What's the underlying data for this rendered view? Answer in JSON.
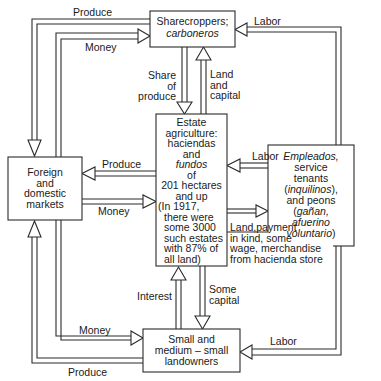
{
  "nodes": {
    "sharecroppers": {
      "line1": "Sharecroppers;",
      "line2": "carboneros"
    },
    "estate": {
      "lines": [
        "Estate",
        "agriculture:",
        "haciendas",
        "and",
        "fundos",
        "of",
        "201 hectares",
        "and up",
        "(In 1917,",
        "there were",
        "some 3000",
        "such estates",
        "with 87% of",
        "all land)"
      ]
    },
    "markets": {
      "lines": [
        "Foreign",
        "and",
        "domestic",
        "markets"
      ]
    },
    "workers": {
      "lines": [
        "Empleados,",
        "service",
        "tenants",
        "(inquilinos),",
        "and peons",
        "(gañan,",
        "afuerino",
        "voluntario)"
      ]
    },
    "landowners": {
      "lines": [
        "Small and",
        "medium – small",
        "landowners"
      ]
    }
  },
  "flows": {
    "produce_top": "Produce",
    "money_top": "Money",
    "labor_top": "Labor",
    "share_of_produce": [
      "Share",
      "of",
      "produce"
    ],
    "land_and_capital": [
      "Land",
      "and",
      "capital"
    ],
    "produce_mid": "Produce",
    "money_mid": "Money",
    "labor_mid": "Labor",
    "land_payment": [
      "Land,payment",
      "in kind, some",
      "wage, merchandise",
      "from hacienda store"
    ],
    "interest": "Interest",
    "some_capital": [
      "Some",
      "capital"
    ],
    "money_bottom": "Money",
    "labor_bottom": "Labor",
    "produce_bottom": "Produce"
  },
  "colors": {
    "line": "#2a2a2a",
    "background": "#ffffff",
    "text": "#1a1a1a"
  }
}
